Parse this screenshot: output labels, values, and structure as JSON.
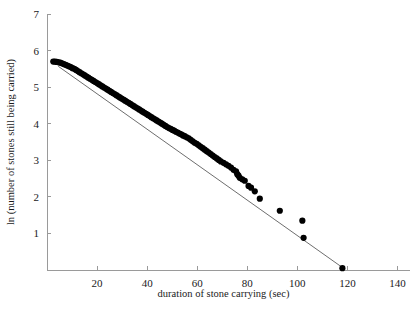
{
  "chart_data": {
    "type": "scatter",
    "title": "",
    "subtitle": "",
    "xlabel": "duration of stone carrying (sec)",
    "ylabel": "ln (number of stones still being carried)",
    "xlim": [
      0,
      145
    ],
    "ylim": [
      0,
      7
    ],
    "xticks": [
      20,
      40,
      60,
      80,
      100,
      120,
      140
    ],
    "yticks": [
      1,
      2,
      3,
      4,
      5,
      6,
      7
    ],
    "xtick_labels": [
      "20",
      "40",
      "60",
      "80",
      "100",
      "120",
      "140"
    ],
    "ytick_labels": [
      "1",
      "2",
      "3",
      "4",
      "5",
      "6",
      "7"
    ],
    "grid": false,
    "legend": null,
    "annotations": [],
    "marker": {
      "shape": "circle",
      "color": "#000000",
      "size_px": 3.1
    },
    "series": [
      {
        "name": "stones still being carried",
        "type": "scatter",
        "color": "#000000",
        "points": [
          [
            2.5,
            5.7
          ],
          [
            3.2,
            5.7
          ],
          [
            3.9,
            5.69
          ],
          [
            4.6,
            5.68
          ],
          [
            5.3,
            5.67
          ],
          [
            6.0,
            5.65
          ],
          [
            6.7,
            5.63
          ],
          [
            7.4,
            5.61
          ],
          [
            8.1,
            5.59
          ],
          [
            8.8,
            5.57
          ],
          [
            9.5,
            5.55
          ],
          [
            10.2,
            5.52
          ],
          [
            10.9,
            5.5
          ],
          [
            11.6,
            5.47
          ],
          [
            12.3,
            5.44
          ],
          [
            13.0,
            5.41
          ],
          [
            13.7,
            5.38
          ],
          [
            14.4,
            5.35
          ],
          [
            15.1,
            5.32
          ],
          [
            15.8,
            5.29
          ],
          [
            16.5,
            5.26
          ],
          [
            17.2,
            5.23
          ],
          [
            17.9,
            5.2
          ],
          [
            18.6,
            5.17
          ],
          [
            19.3,
            5.14
          ],
          [
            20.0,
            5.11
          ],
          [
            20.7,
            5.08
          ],
          [
            21.4,
            5.05
          ],
          [
            22.1,
            5.02
          ],
          [
            22.8,
            4.99
          ],
          [
            23.5,
            4.96
          ],
          [
            24.2,
            4.93
          ],
          [
            24.9,
            4.9
          ],
          [
            25.6,
            4.87
          ],
          [
            26.3,
            4.84
          ],
          [
            27.0,
            4.81
          ],
          [
            27.7,
            4.78
          ],
          [
            28.4,
            4.75
          ],
          [
            29.1,
            4.72
          ],
          [
            29.8,
            4.69
          ],
          [
            30.5,
            4.66
          ],
          [
            31.2,
            4.63
          ],
          [
            31.9,
            4.6
          ],
          [
            32.6,
            4.57
          ],
          [
            33.3,
            4.54
          ],
          [
            34.0,
            4.51
          ],
          [
            34.7,
            4.48
          ],
          [
            35.4,
            4.45
          ],
          [
            36.1,
            4.42
          ],
          [
            36.8,
            4.39
          ],
          [
            37.5,
            4.36
          ],
          [
            38.2,
            4.33
          ],
          [
            38.9,
            4.3
          ],
          [
            39.6,
            4.27
          ],
          [
            40.3,
            4.24
          ],
          [
            41.0,
            4.21
          ],
          [
            41.7,
            4.18
          ],
          [
            42.4,
            4.15
          ],
          [
            43.1,
            4.12
          ],
          [
            43.8,
            4.09
          ],
          [
            44.5,
            4.06
          ],
          [
            45.2,
            4.03
          ],
          [
            45.9,
            4.0
          ],
          [
            46.6,
            3.97
          ],
          [
            47.3,
            3.94
          ],
          [
            48.0,
            3.91
          ],
          [
            48.7,
            3.88
          ],
          [
            49.4,
            3.86
          ],
          [
            50.1,
            3.83
          ],
          [
            50.8,
            3.81
          ],
          [
            51.5,
            3.78
          ],
          [
            52.2,
            3.76
          ],
          [
            52.9,
            3.73
          ],
          [
            53.6,
            3.71
          ],
          [
            54.3,
            3.68
          ],
          [
            55.0,
            3.66
          ],
          [
            55.8,
            3.63
          ],
          [
            56.6,
            3.6
          ],
          [
            57.4,
            3.56
          ],
          [
            58.2,
            3.52
          ],
          [
            59.0,
            3.48
          ],
          [
            59.8,
            3.45
          ],
          [
            60.6,
            3.41
          ],
          [
            61.4,
            3.37
          ],
          [
            62.2,
            3.33
          ],
          [
            63.0,
            3.29
          ],
          [
            63.8,
            3.25
          ],
          [
            64.6,
            3.21
          ],
          [
            65.4,
            3.17
          ],
          [
            66.2,
            3.13
          ],
          [
            67.0,
            3.09
          ],
          [
            67.8,
            3.05
          ],
          [
            68.6,
            3.01
          ],
          [
            69.4,
            2.97
          ],
          [
            70.5,
            2.93
          ],
          [
            71.5,
            2.89
          ],
          [
            72.5,
            2.85
          ],
          [
            73.5,
            2.8
          ],
          [
            74.5,
            2.74
          ],
          [
            75.5,
            2.7
          ],
          [
            76.0,
            2.62
          ],
          [
            76.5,
            2.58
          ],
          [
            77.0,
            2.52
          ],
          [
            78.0,
            2.48
          ],
          [
            79.0,
            2.44
          ],
          [
            80.5,
            2.3
          ],
          [
            81.5,
            2.25
          ],
          [
            83.0,
            2.15
          ],
          [
            85.0,
            1.95
          ],
          [
            93.0,
            1.62
          ],
          [
            102.0,
            1.35
          ],
          [
            102.5,
            0.88
          ],
          [
            118.0,
            0.05
          ]
        ]
      }
    ],
    "fit_line": {
      "name": "linear fit",
      "color": "#6e6e6e",
      "x_start": 4.5,
      "y_start": 5.57,
      "x_end": 119.0,
      "y_end": 0.02
    }
  }
}
